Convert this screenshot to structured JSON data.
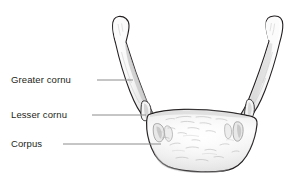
{
  "figure": {
    "view": "anterior-superior",
    "background_color": "#ffffff",
    "outline_color": "#231f20",
    "bone_fill_color": "#f2f2f2",
    "bone_shadow_color": "#c9c9c9",
    "leader_line_color": "#8c8c8c",
    "text_color": "#231f20"
  },
  "labels": [
    {
      "id": "greater-cornu",
      "text": "Greater cornu",
      "leader": {
        "x1": 97,
        "y1": 80,
        "x2": 133,
        "y2": 80
      }
    },
    {
      "id": "lesser-cornu",
      "text": "Lesser cornu",
      "leader": {
        "x1": 92,
        "y1": 115,
        "x2": 146,
        "y2": 115
      }
    },
    {
      "id": "corpus",
      "text": "Corpus",
      "leader": {
        "x1": 63,
        "y1": 144,
        "x2": 161,
        "y2": 144
      }
    }
  ]
}
